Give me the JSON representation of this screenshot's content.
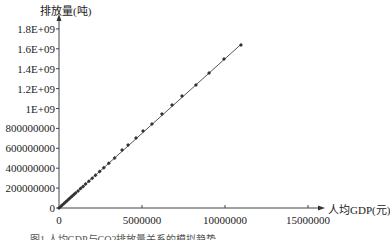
{
  "chart_data": {
    "type": "scatter",
    "title": "",
    "xlabel": "人均GDP(元)",
    "ylabel": "排放量(吨)",
    "xlim": [
      0,
      15000000
    ],
    "ylim": [
      0,
      1800000000
    ],
    "x_ticks": [
      "0",
      "5000000",
      "10000000",
      "15000000"
    ],
    "y_ticks": [
      "0",
      "200000000",
      "400000000",
      "600000000",
      "800000000",
      "1E+09",
      "1.2E+09",
      "1.4E+09",
      "1.6E+09",
      "1.8E+09"
    ],
    "grid": false,
    "legend": null,
    "trendline": {
      "type": "linear",
      "from": [
        0,
        0
      ],
      "to": [
        11000000,
        1650000000
      ]
    },
    "series": [
      {
        "name": "排放量",
        "marker": "diamond",
        "x": [
          0,
          100000,
          200000,
          300000,
          400000,
          500000,
          600000,
          700000,
          800000,
          900000,
          1000000,
          1150000,
          1300000,
          1450000,
          1600000,
          1800000,
          2000000,
          2200000,
          2450000,
          2700000,
          3000000,
          3350000,
          3800000,
          4160000,
          4640000,
          5060000,
          5600000,
          6200000,
          6810000,
          7410000,
          8250000,
          9040000,
          9940000,
          10960000
        ],
        "y": [
          0,
          15000000,
          30000000,
          45000000,
          60000000,
          75000000,
          90000000,
          105000000,
          120000000,
          135000000,
          150000000,
          172000000,
          195000000,
          217000000,
          240000000,
          270000000,
          300000000,
          330000000,
          367000000,
          405000000,
          450000000,
          502000000,
          583000000,
          633000000,
          704000000,
          774000000,
          844000000,
          945000000,
          1035000000,
          1126000000,
          1236000000,
          1357000000,
          1497000000,
          1638000000
        ]
      }
    ]
  },
  "labels": {
    "y_title": "排放量(吨)",
    "x_title": "人均GDP(元)",
    "x_ticks": [
      "0",
      "5000000",
      "10000000",
      "15000000"
    ],
    "y_ticks": [
      "1.8E+09",
      "1.6E+09",
      "1.4E+09",
      "1.2E+09",
      "1E+09",
      "800000000",
      "600000000",
      "400000000",
      "200000000",
      "0"
    ],
    "caption": "图1  人均GDP与CO2排放量关系的模拟趋势"
  }
}
